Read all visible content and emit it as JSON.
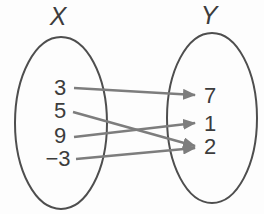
{
  "diagram": {
    "type": "mapping-diagram",
    "colors": {
      "background": "#fdfdfd",
      "oval_stroke": "#4e4e4e",
      "arrow": "#7d7d7d",
      "text": "#3c3c3c"
    },
    "sets": {
      "x": {
        "label": "X",
        "elements": [
          "3",
          "5",
          "9",
          "−3"
        ]
      },
      "y": {
        "label": "Y",
        "elements": [
          "7",
          "1",
          "2"
        ]
      }
    },
    "mappings": [
      {
        "from": "3",
        "to": "7"
      },
      {
        "from": "5",
        "to": "2"
      },
      {
        "from": "9",
        "to": "1"
      },
      {
        "from": "−3",
        "to": "2"
      }
    ]
  }
}
